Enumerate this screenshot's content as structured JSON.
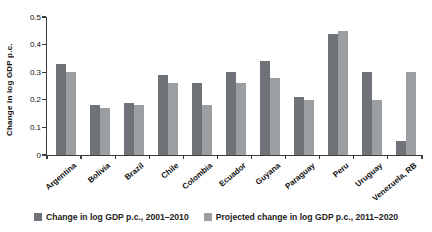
{
  "chart_data": {
    "type": "bar",
    "title": "",
    "ylabel": "Change in log GDP p.c.",
    "xlabel": "",
    "ylim": [
      0,
      0.5
    ],
    "ytick_labels": [
      "0",
      "0.1",
      "0.2",
      "0.3",
      "0.4",
      "0.5"
    ],
    "yticks": [
      0,
      0.1,
      0.2,
      0.3,
      0.4,
      0.5
    ],
    "grid": false,
    "legend_position": "bottom",
    "categories": [
      "Argentina",
      "Bolivia",
      "Brazil",
      "Chile",
      "Colombia",
      "Ecuador",
      "Guyana",
      "Paraguay",
      "Peru",
      "Uruguay",
      "Venezuela, RB"
    ],
    "series": [
      {
        "name": "Change in log GDP p.c., 2001–2010",
        "color": "#6f7276",
        "values": [
          0.33,
          0.18,
          0.19,
          0.29,
          0.26,
          0.3,
          0.34,
          0.21,
          0.44,
          0.3,
          0.05
        ]
      },
      {
        "name": "Projected change in log GDP p.c., 2011–2020",
        "color": "#9c9fa1",
        "values": [
          0.3,
          0.17,
          0.18,
          0.26,
          0.18,
          0.26,
          0.28,
          0.2,
          0.45,
          0.2,
          0.3
        ]
      }
    ],
    "axis_color": "#3c3c3c"
  }
}
